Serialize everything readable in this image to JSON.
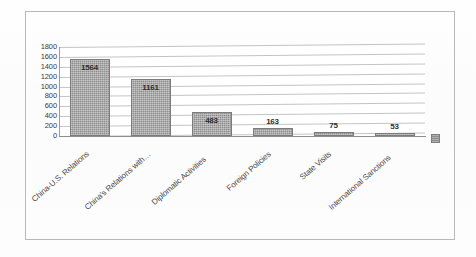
{
  "chart_data": {
    "type": "bar",
    "title": "",
    "subtitle": "",
    "xlabel": "",
    "ylabel": "",
    "categories": [
      "China-U.S. Relations",
      "China's Relations with…",
      "Diplomatic Activities",
      "Foreign Policies",
      "State Visits",
      "International Sanctions"
    ],
    "values": [
      1564,
      1161,
      483,
      163,
      75,
      53
    ],
    "data_labels": [
      "1564",
      "1161",
      "483",
      "163",
      "75",
      "53"
    ],
    "ylim": [
      0,
      1800
    ],
    "ytick_step": 200,
    "yticks": [
      "1800",
      "1600",
      "1400",
      "1200",
      "1000",
      "800",
      "600",
      "400",
      "200",
      "0"
    ],
    "grid": true,
    "grid_axis": "y",
    "legend": false,
    "legend_position": "right",
    "bar_color": "#8e8e8e",
    "gridline_color": "#c4c4c4",
    "axis_color": "#8d8d8d",
    "label_color": "#2f2f2f"
  },
  "figure": {
    "border_color": "#b9b9b9",
    "background": "#ffffff",
    "legend_marker_present": true
  }
}
